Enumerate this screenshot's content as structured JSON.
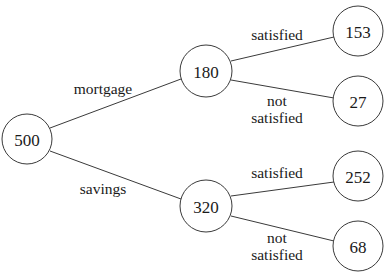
{
  "diagram": {
    "type": "probability-tree",
    "nodes": {
      "root": {
        "label": "500",
        "cx": 27,
        "cy": 139,
        "r": 25
      },
      "mortgage": {
        "label": "180",
        "cx": 206,
        "cy": 71,
        "r": 26
      },
      "savings": {
        "label": "320",
        "cx": 206,
        "cy": 206,
        "r": 26
      },
      "mortgage_satisfied": {
        "label": "153",
        "cx": 358,
        "cy": 31,
        "r": 25
      },
      "mortgage_not_satisfied": {
        "label": "27",
        "cx": 358,
        "cy": 101,
        "r": 25
      },
      "savings_satisfied": {
        "label": "252",
        "cx": 358,
        "cy": 176,
        "r": 25
      },
      "savings_not_satisfied": {
        "label": "68",
        "cx": 358,
        "cy": 246,
        "r": 25
      }
    },
    "edges": {
      "root_to_mortgage": {
        "label": "mortgage"
      },
      "root_to_savings": {
        "label": "savings"
      },
      "mortgage_to_satisfied": {
        "label": "satisfied"
      },
      "mortgage_to_not_satisfied": {
        "label_line1": "not",
        "label_line2": "satisfied"
      },
      "savings_to_satisfied": {
        "label": "satisfied"
      },
      "savings_to_not_satisfied": {
        "label_line1": "not",
        "label_line2": "satisfied"
      }
    }
  }
}
